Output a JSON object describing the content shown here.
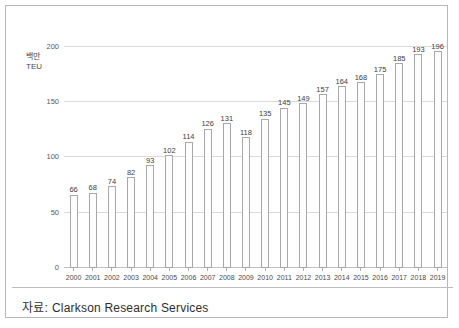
{
  "chart_data": {
    "type": "bar",
    "title": "",
    "xlabel": "",
    "ylabel": "백만 TEU",
    "unit_lines": [
      "백만",
      "TEU"
    ],
    "ylim": [
      0,
      215
    ],
    "yticks": [
      0,
      50,
      100,
      150,
      200
    ],
    "ytick_labels": [
      "0",
      "50",
      "100",
      "150",
      "200"
    ],
    "grid": true,
    "legend": "none",
    "categories": [
      "2000",
      "2001",
      "2002",
      "2003",
      "2004",
      "2005",
      "2006",
      "2007",
      "2008",
      "2009",
      "2010",
      "2011",
      "2012",
      "2013",
      "2014",
      "2015",
      "2016",
      "2017",
      "2018",
      "2019"
    ],
    "values": [
      66,
      68,
      74,
      82,
      93,
      102,
      114,
      126,
      131,
      118,
      135,
      145,
      149,
      157,
      164,
      168,
      175,
      185,
      193,
      196
    ],
    "data_labels": [
      "66",
      "68",
      "74",
      "82",
      "93",
      "102",
      "114",
      "126",
      "131",
      "118",
      "135",
      "145",
      "149",
      "157",
      "164",
      "168",
      "175",
      "185",
      "193",
      "196"
    ]
  },
  "source": {
    "label": "자료:",
    "text": "Clarkson  Research  Services"
  },
  "colors": {
    "bar_fill": "#fdfdfd",
    "bar_stroke": "#a8a8a8",
    "gridline": "#d9d9d9",
    "frame": "#b7b7b7",
    "text": "#3d3d3d"
  }
}
